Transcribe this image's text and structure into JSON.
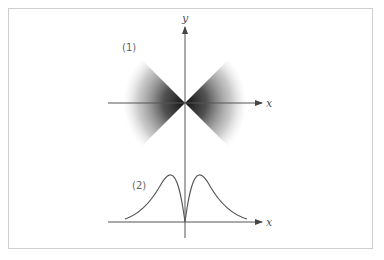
{
  "figure": {
    "panel1": {
      "label": "(1)",
      "description": "Two opposite shaded cones (double cone) with vertex at origin, opening along the x-axis, darker near the vertex and fading outward",
      "axis_x_label": "x",
      "axis_y_label": "y"
    },
    "panel2": {
      "label": "(2)",
      "description": "Symmetric bimodal curve touching zero at origin, two peaks either side, tails decaying toward x-axis",
      "axis_x_label": "x"
    },
    "colors": {
      "axis": "#555555",
      "shade_dark": "#1a1a1a",
      "curve": "#555555",
      "frame": "#cfcfcf"
    }
  }
}
